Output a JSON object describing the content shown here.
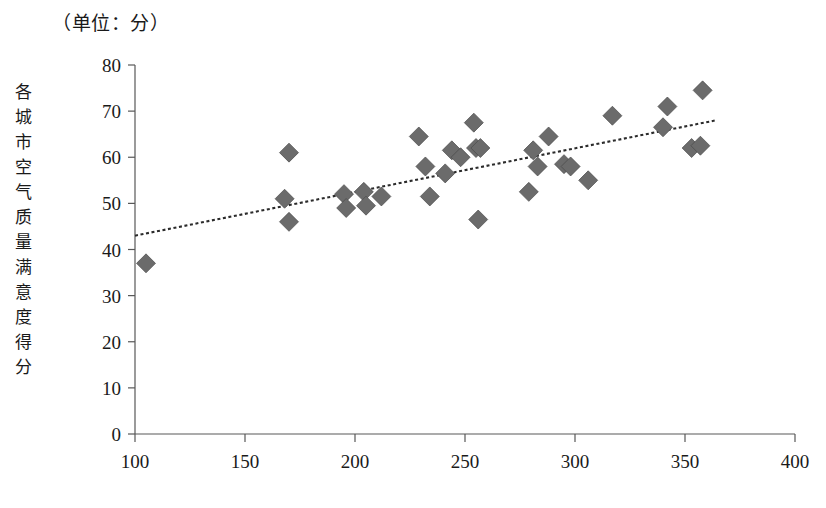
{
  "figure": {
    "unit_note": "（单位：分）",
    "y_axis_title": "各城市空气质量满意度得分"
  },
  "chart_data": {
    "type": "scatter",
    "title": "",
    "subtitle": "",
    "unit_note": "（单位：分）",
    "xlabel": "",
    "ylabel": "各城市空气质量满意度得分",
    "xlim": [
      100,
      400
    ],
    "ylim": [
      0,
      80
    ],
    "xticks": [
      100,
      150,
      200,
      250,
      300,
      350,
      400
    ],
    "xtick_labels": [
      "100",
      "150",
      "200",
      "250",
      "300",
      "350",
      "400"
    ],
    "yticks": [
      0,
      10,
      20,
      30,
      40,
      50,
      60,
      70,
      80
    ],
    "ytick_labels": [
      "0",
      "10",
      "20",
      "30",
      "40",
      "50",
      "60",
      "70",
      "80"
    ],
    "grid": false,
    "legend": false,
    "legend_position": "none",
    "marker_shape": "diamond",
    "marker_color": "#6b6b6b",
    "series": [
      {
        "name": "各城市",
        "points": [
          [
            105,
            37.0
          ],
          [
            168,
            51.0
          ],
          [
            170,
            61.0
          ],
          [
            170,
            46.0
          ],
          [
            195,
            52.0
          ],
          [
            196,
            49.0
          ],
          [
            204,
            52.5
          ],
          [
            205,
            49.5
          ],
          [
            212,
            51.5
          ],
          [
            229,
            64.5
          ],
          [
            232,
            58.0
          ],
          [
            234,
            51.5
          ],
          [
            241,
            56.5
          ],
          [
            244,
            61.5
          ],
          [
            248,
            60.0
          ],
          [
            254,
            67.5
          ],
          [
            255,
            62.0
          ],
          [
            256,
            46.5
          ],
          [
            257,
            62.0
          ],
          [
            279,
            52.5
          ],
          [
            281,
            61.5
          ],
          [
            283,
            58.0
          ],
          [
            288,
            64.5
          ],
          [
            295,
            58.5
          ],
          [
            298,
            58.0
          ],
          [
            306,
            55.0
          ],
          [
            317,
            69.0
          ],
          [
            340,
            66.5
          ],
          [
            342,
            71.0
          ],
          [
            353,
            62.0
          ],
          [
            357,
            62.5
          ],
          [
            358,
            74.5
          ]
        ]
      }
    ],
    "trendline": {
      "type": "linear",
      "style": "dotted",
      "color": "#2b2b2b",
      "x_start": 100,
      "x_end": 364,
      "y_start": 43.0,
      "y_end": 68.0
    }
  }
}
